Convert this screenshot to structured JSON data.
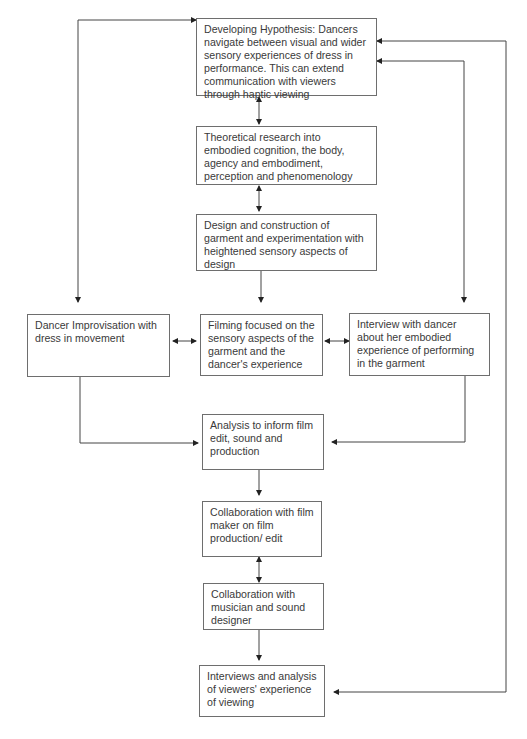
{
  "diagram": {
    "type": "flowchart",
    "nodes": [
      {
        "id": "hypothesis",
        "text": "Developing Hypothesis: Dancers navigate between visual and wider sensory experiences of dress in performance. This can extend communication with viewers through haptic viewing"
      },
      {
        "id": "theory",
        "text": "Theoretical research into embodied cognition, the body, agency and embodiment, perception and phenomenology"
      },
      {
        "id": "design",
        "text": "Design and construction of garment and experimentation with heightened sensory aspects of design"
      },
      {
        "id": "improvisation",
        "text": "Dancer Improvisation with dress in movement"
      },
      {
        "id": "filming",
        "text": "Filming focused on the sensory aspects of the garment and the dancer's experience"
      },
      {
        "id": "interview",
        "text": "Interview with dancer about her embodied experience of performing in the garment"
      },
      {
        "id": "analysis",
        "text": "Analysis to inform film edit, sound and production"
      },
      {
        "id": "film_collab",
        "text": "Collaboration with film maker on  film production/ edit"
      },
      {
        "id": "music_collab",
        "text": "Collaboration with musician and sound designer"
      },
      {
        "id": "viewer_interviews",
        "text": "Interviews and analysis of viewers' experience of viewing"
      }
    ],
    "edges": [
      {
        "from": "hypothesis",
        "to": "theory",
        "bidirectional": true
      },
      {
        "from": "theory",
        "to": "design",
        "bidirectional": true
      },
      {
        "from": "design",
        "to": "filming",
        "bidirectional": false
      },
      {
        "from": "hypothesis",
        "to": "improvisation",
        "bidirectional": true
      },
      {
        "from": "hypothesis",
        "to": "interview",
        "bidirectional": true
      },
      {
        "from": "improvisation",
        "to": "filming",
        "bidirectional": true
      },
      {
        "from": "filming",
        "to": "interview",
        "bidirectional": true
      },
      {
        "from": "improvisation",
        "to": "analysis",
        "bidirectional": false
      },
      {
        "from": "interview",
        "to": "analysis",
        "bidirectional": false
      },
      {
        "from": "analysis",
        "to": "film_collab",
        "bidirectional": false
      },
      {
        "from": "film_collab",
        "to": "music_collab",
        "bidirectional": true
      },
      {
        "from": "music_collab",
        "to": "viewer_interviews",
        "bidirectional": false
      },
      {
        "from": "viewer_interviews",
        "to": "hypothesis",
        "bidirectional": true
      }
    ]
  }
}
